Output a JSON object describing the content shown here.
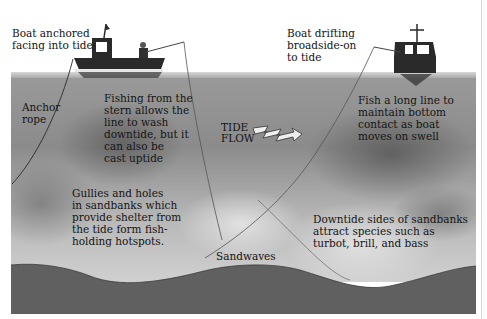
{
  "diagram": {
    "labels": {
      "boat_anchored": [
        "Boat anchored",
        "facing into tide"
      ],
      "boat_drifting": [
        "Boat drifting",
        "broadside-on",
        "to tide"
      ],
      "anchor_rope": [
        "Anchor",
        "rope"
      ],
      "fishing_stern": [
        "Fishing from the",
        "stern allows the",
        "line to wash",
        "downtide, but it",
        "can also be",
        "cast uptide"
      ],
      "long_line": [
        "Fish a long line to",
        "maintain bottom",
        "contact as boat",
        "moves on swell"
      ],
      "tide_flow": [
        "TIDE",
        "FLOW"
      ],
      "gullies": [
        "Gullies and holes",
        "in sandbanks which",
        "provide shelter from",
        "the tide form fish-",
        "holding hotspots."
      ],
      "downtide": [
        "Downtide sides of sandbanks",
        "attract species such as",
        "turbot, brill, and bass"
      ],
      "sandwaves": "Sandwaves"
    },
    "colors": {
      "water": "#9a9a9a",
      "seabed": "#5e5e5e",
      "boat_hull": "#2a2a2a",
      "text": "#141414",
      "background": "#ffffff"
    }
  }
}
